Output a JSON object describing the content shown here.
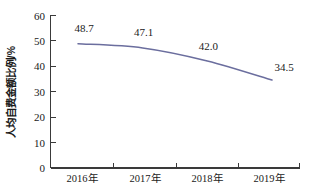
{
  "chart_data": {
    "type": "line",
    "title": "",
    "xlabel": "",
    "ylabel": "人均自费金额比例/%",
    "categories": [
      "2016年",
      "2017年",
      "2018年",
      "2019年"
    ],
    "values": [
      48.7,
      47.1,
      42.0,
      34.5
    ],
    "value_labels": [
      "48.7",
      "47.1",
      "42.0",
      "34.5"
    ],
    "series": [
      {
        "name": "人均自费金额比例",
        "values": [
          48.7,
          47.1,
          42.0,
          34.5
        ],
        "color": "#6b6e9e"
      }
    ],
    "ylim": [
      0,
      60
    ],
    "yticks": [
      0,
      10,
      20,
      30,
      40,
      50,
      60
    ],
    "ytick_labels": [
      "0",
      "10",
      "20",
      "30",
      "40",
      "50",
      "60"
    ],
    "grid": false,
    "legend": false,
    "legend_position": "none",
    "markers": false,
    "smoothing": "spline"
  },
  "colors": {
    "line": "#6b6e9e",
    "axis": "#3a3a3a",
    "text": "#1a1a1a",
    "background": "#ffffff"
  }
}
